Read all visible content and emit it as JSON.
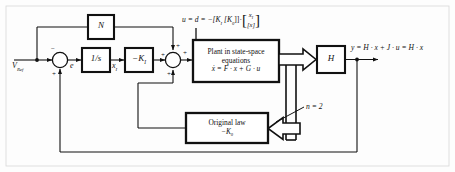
{
  "diagram": {
    "colors": {
      "line": "#111111",
      "background": "#fdfdfd",
      "box_fill": "#ffffff",
      "box_stroke": "#000000"
    },
    "signals": {
      "reference": "V",
      "reference_sub": "Ref",
      "error": "e",
      "integrator_state": "x",
      "integrator_state_sub": "I",
      "output_equation": "y = H · x + J · u = H · x",
      "control_equation_lhs": "u = d = −[K",
      "control_equation_lhs_sub": "I",
      "control_equation_mid": "[K",
      "control_equation_mid_sub": "0",
      "control_equation_close": "]]·",
      "vector_top": "x",
      "vector_top_sub": "I",
      "vector_bottom": "[x]",
      "bus_width_label": "n = 2"
    },
    "blocks": [
      {
        "id": "feedforward",
        "label": "N",
        "data_name": "block-n"
      },
      {
        "id": "integrator",
        "label": "1/s",
        "data_name": "block-integrator"
      },
      {
        "id": "gain_ki",
        "label": "−K",
        "label_sub": "I",
        "data_name": "block-gain-ki"
      },
      {
        "id": "plant",
        "line1": "Plant in state-space",
        "line2": "equations",
        "line3": "ẋ = F · x + G · u",
        "data_name": "block-plant"
      },
      {
        "id": "output_gain",
        "label": "H",
        "data_name": "block-h"
      },
      {
        "id": "original_law",
        "line1": "Original law",
        "line2": "−K",
        "line2_sub": "0",
        "data_name": "block-original-law"
      }
    ],
    "summing_junctions": [
      {
        "id": "sum1",
        "data_name": "summing-junction-error",
        "signs": {
          "top": "−",
          "bottom": "+",
          "left": "+"
        }
      },
      {
        "id": "sum2",
        "data_name": "summing-junction-control",
        "signs": {
          "top": "+",
          "bottom": "+",
          "left": "+",
          "right": "+"
        }
      }
    ]
  }
}
